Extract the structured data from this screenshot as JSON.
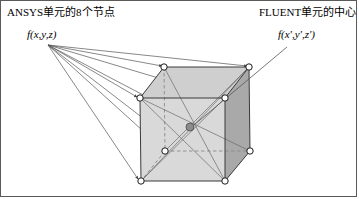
{
  "figure": {
    "type": "diagram",
    "border_color": "#5a5a5a",
    "background": "#ffffff"
  },
  "labels": {
    "title_left": "ANSYS单元的8个节点",
    "title_right": "FLUENT单元的中心",
    "source_function": "f(x,y,z)",
    "target_function": "f(x',y',z')"
  },
  "colors": {
    "face_front": "#d9d9d9",
    "face_top": "#cfcfcf",
    "face_right": "#a9a9a9",
    "edge": "#3a3a3a",
    "hidden_edge": "#8a8a8a",
    "node_fill": "#ffffff",
    "node_stroke": "#1a1a1a",
    "centre_fill": "#8c8c8c",
    "centre_stroke": "#4a4a4a",
    "leader": "#555555"
  },
  "geometry": {
    "fan_origin": {
      "x": 47,
      "y": 44
    },
    "centre_arrow_origin": {
      "x": 286,
      "y": 46
    },
    "centre_point": {
      "x": 189,
      "y": 126,
      "r": 4
    },
    "node_radius": 3.2,
    "nodes": [
      {
        "id": "front-top-left",
        "x": 139,
        "y": 97,
        "hidden": false
      },
      {
        "id": "front-top-right",
        "x": 224,
        "y": 97,
        "hidden": false
      },
      {
        "id": "front-bottom-left",
        "x": 140,
        "y": 180,
        "hidden": false
      },
      {
        "id": "front-bottom-right",
        "x": 224,
        "y": 180,
        "hidden": false
      },
      {
        "id": "back-top-left",
        "x": 163,
        "y": 66,
        "hidden": false
      },
      {
        "id": "back-top-right",
        "x": 248,
        "y": 66,
        "hidden": false
      },
      {
        "id": "back-bottom-left",
        "x": 164,
        "y": 150,
        "hidden": true
      },
      {
        "id": "back-bottom-right",
        "x": 249,
        "y": 150,
        "hidden": false
      }
    ],
    "faces": [
      {
        "id": "face-top",
        "points": "139,97 163,66 248,66 224,97",
        "shade": "top"
      },
      {
        "id": "face-right",
        "points": "224,97 248,66 249,150 224,180",
        "shade": "right"
      },
      {
        "id": "face-front",
        "points": "139,97 224,97 224,180 140,180",
        "shade": "front"
      }
    ],
    "solid_edges": [
      "139,97 224,97",
      "224,97 224,180",
      "224,180 140,180",
      "140,180 139,97",
      "139,97 163,66",
      "224,97 248,66",
      "163,66 248,66",
      "248,66 249,150",
      "249,150 224,180"
    ],
    "hidden_edges": [
      "163,66 164,150",
      "164,150 249,150",
      "164,150 140,180"
    ],
    "diagonals": [
      "139,97 249,150",
      "163,66 224,180",
      "164,150 248,66",
      "140,180 248,66"
    ]
  }
}
